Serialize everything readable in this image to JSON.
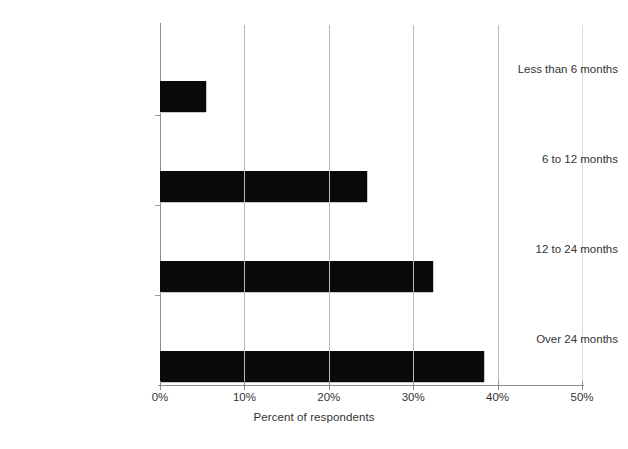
{
  "chart_data": {
    "type": "bar",
    "orientation": "horizontal",
    "title": "",
    "subtitle": "",
    "xlabel": "Percent of respondents",
    "ylabel": "",
    "categories": [
      "Less than 6 months",
      "6 to 12 months",
      "12 to 24 months",
      "Over 24 months"
    ],
    "values": [
      5.5,
      24.5,
      32.3,
      38.4
    ],
    "xtick_labels": [
      "0%",
      "10%",
      "20%",
      "30%",
      "40%",
      "50%"
    ],
    "xtick_values": [
      0,
      10,
      20,
      30,
      40,
      50
    ],
    "xlim": [
      0,
      50
    ],
    "grid": "vertical",
    "legend": "none",
    "bar_color": "#0a0a0a",
    "axis_color": "#8e8e8e",
    "grid_color": "#b9b9b9",
    "background": "#ffffff"
  },
  "axis": {
    "x_title": "Percent of respondents"
  }
}
